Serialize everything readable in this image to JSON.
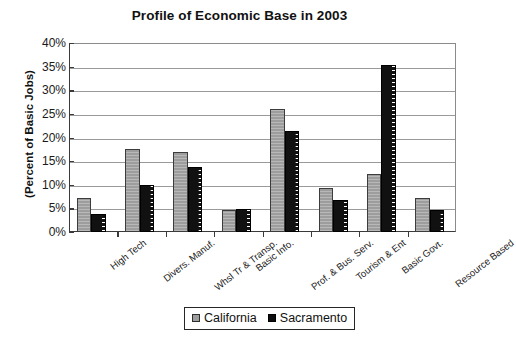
{
  "chart_data": {
    "type": "bar",
    "title": "Profile of Economic Base in 2003",
    "xlabel": "",
    "ylabel": "(Percent of Basic Jobs)",
    "ylim": [
      0,
      40
    ],
    "ytick_step": 5,
    "ytick_labels": [
      "0%",
      "5%",
      "10%",
      "15%",
      "20%",
      "25%",
      "30%",
      "35%",
      "40%"
    ],
    "ytick_values": [
      0,
      5,
      10,
      15,
      20,
      25,
      30,
      35,
      40
    ],
    "grid": true,
    "legend_position": "bottom-center",
    "categories": [
      "High Tech",
      "Divers. Manuf.",
      "Whsl Tr & Transp.",
      "Basic Info.",
      "Prof. & Bus. Serv.",
      "Tourism & Ent",
      "Basic Govt.",
      "Resource Based"
    ],
    "series": [
      {
        "name": "California",
        "color": "#9d9d9d",
        "values": [
          7.2,
          17.5,
          17.0,
          4.6,
          26.0,
          9.3,
          12.2,
          7.2
        ]
      },
      {
        "name": "Sacramento",
        "color": "#111111",
        "values": [
          3.8,
          9.9,
          13.7,
          4.8,
          21.4,
          6.8,
          35.4,
          4.7
        ]
      }
    ]
  },
  "legend": {
    "items": [
      {
        "label": "California",
        "swatch": "california"
      },
      {
        "label": "Sacramento",
        "swatch": "sacramento"
      }
    ]
  }
}
